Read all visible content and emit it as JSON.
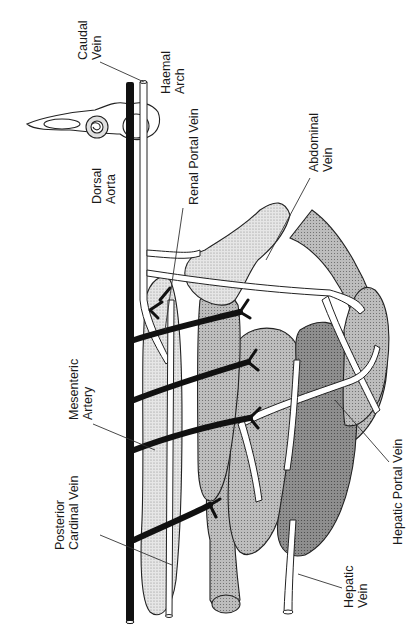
{
  "figure": {
    "orientation": "rotated 90 degrees counter-clockwise"
  },
  "labels": {
    "caudal_vein": [
      "Caudal",
      "Vein"
    ],
    "haemal_arch": [
      "Haemal",
      "Arch"
    ],
    "dorsal_aorta": [
      "Dorsal",
      "Aorta"
    ],
    "renal_portal_vein": "Renal Portal Vein",
    "abdominal_vein": [
      "Abdominal",
      "Vein"
    ],
    "mesenteric_artery": [
      "Mesenteric",
      "Artery"
    ],
    "posterior_cardinal_vein": [
      "Posterior",
      "Cardinal Vein"
    ],
    "hepatic_portal_vein": "Hepatic Portal Vein",
    "hepatic_vein": [
      "Hepatic",
      "Vein"
    ]
  },
  "colors": {
    "artery": "#111111",
    "vein": "#ffffff",
    "kidney": "#d9d9d9",
    "gut": "#b8b8b8",
    "liver_dark": "#8c8c8c",
    "liver_light": "#c4c4c4",
    "gland_stipple": "#cfcfcf",
    "outline": "#222222"
  }
}
